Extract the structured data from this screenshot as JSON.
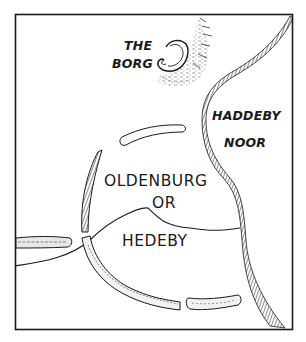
{
  "map": {
    "labels": {
      "borg_line1": "THE",
      "borg_line2": "BORG",
      "noor_line1": "HADDEBY",
      "noor_line2": "NOOR",
      "town_line1": "OLDENBURG",
      "town_line2": "OR",
      "town_line3": "HEDEBY"
    },
    "features": [
      "the-borg-hillfort",
      "haddeby-noor-shoreline",
      "semicircular-rampart",
      "stream",
      "rampart-segments"
    ],
    "colors": {
      "ink": "#1a1a1a",
      "paper": "#ffffff"
    }
  }
}
